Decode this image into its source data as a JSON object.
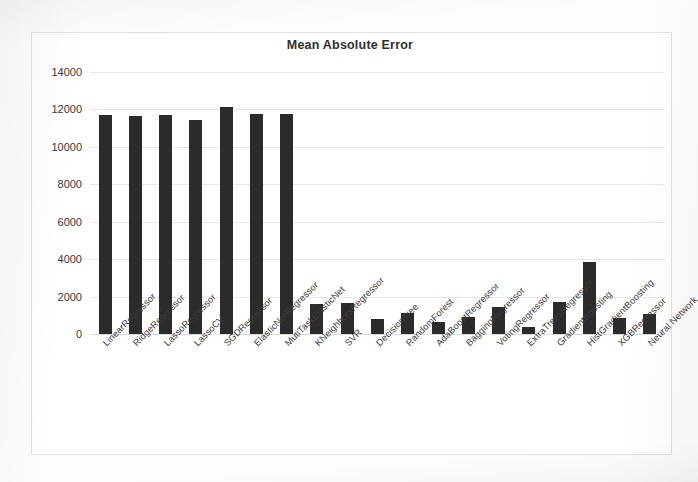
{
  "chart_data": {
    "type": "bar",
    "title": "Mean Absolute Error",
    "xlabel": "",
    "ylabel": "",
    "ylim": [
      0,
      14000
    ],
    "ytick_labels": [
      "14000",
      "12000",
      "10000",
      "8000",
      "6000",
      "4000",
      "2000",
      "0"
    ],
    "ytick_values": [
      14000,
      12000,
      10000,
      8000,
      6000,
      4000,
      2000,
      0
    ],
    "grid": true,
    "legend": false,
    "bar_color": "#2b2b2b",
    "categories": [
      "LinearRegressor",
      "RidgeRegressor",
      "LassoRegressor",
      "LassoCV",
      "SGDRegressor",
      "ElasticNetRegressor",
      "MutiTaskElasticNet",
      "KNeighborsRegressor",
      "SVR",
      "DecisionTree",
      "RandomForest",
      "AdaBoostRegressor",
      "BaggingRegressor",
      "VotingRegressor",
      "ExtraTreesRegressor",
      "GradientBoosting",
      "HistGradientBoosting",
      "XGBRegressor",
      "Neural Network"
    ],
    "values": [
      11700,
      11650,
      11720,
      11450,
      12150,
      11780,
      11760,
      1600,
      1650,
      800,
      1100,
      620,
      900,
      1450,
      400,
      1700,
      3850,
      850,
      1050
    ]
  }
}
